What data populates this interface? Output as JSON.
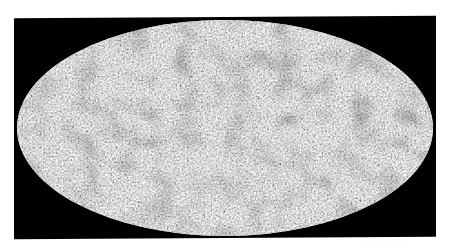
{
  "figure": {
    "type": "all-sky map",
    "projection": "Mollweide",
    "colormap": "grayscale",
    "background_color": "#000000",
    "page_color": "#ffffff",
    "caption": "· · · · · · · · ·"
  }
}
